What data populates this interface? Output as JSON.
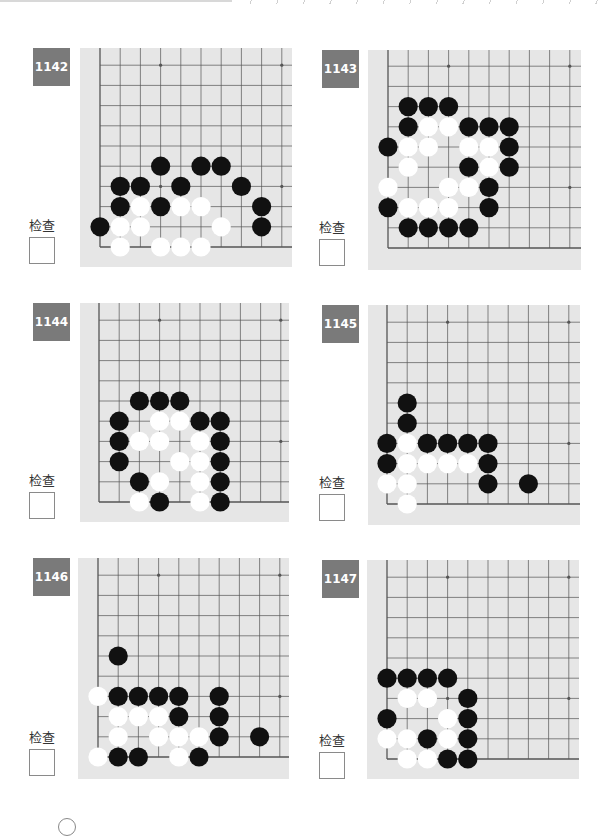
{
  "header": {
    "decoration": "dashed-rule"
  },
  "check_label": "检查",
  "colors": {
    "badge": "#7a7a7a",
    "board": "#e6e6e6",
    "line": "#555555",
    "black": "#111111",
    "white": "#ffffff"
  },
  "problems": [
    {
      "number": "1142",
      "badge": {
        "x": 33,
        "y": 48
      },
      "board": {
        "x": 80,
        "y": 48,
        "w": 212,
        "h": 219
      },
      "origin": {
        "x": 100,
        "y": 247
      },
      "step": 20.2,
      "check": {
        "x": 30,
        "y": 215
      },
      "black": [
        [
          0,
          1
        ],
        [
          8,
          1
        ],
        [
          1,
          2
        ],
        [
          3,
          2
        ],
        [
          8,
          2
        ],
        [
          1,
          3
        ],
        [
          2,
          3
        ],
        [
          4,
          3
        ],
        [
          7,
          3
        ],
        [
          3,
          4
        ],
        [
          5,
          4
        ],
        [
          6,
          4
        ]
      ],
      "white": [
        [
          1,
          0
        ],
        [
          3,
          0
        ],
        [
          4,
          0
        ],
        [
          5,
          0
        ],
        [
          1,
          1
        ],
        [
          2,
          1
        ],
        [
          6,
          1
        ],
        [
          2,
          2
        ],
        [
          4,
          2
        ],
        [
          5,
          2
        ]
      ]
    },
    {
      "number": "1143",
      "badge": {
        "x": 322,
        "y": 50
      },
      "board": {
        "x": 368,
        "y": 50,
        "w": 213,
        "h": 220
      },
      "origin": {
        "x": 388,
        "y": 248
      },
      "step": 20.2,
      "check": {
        "x": 320,
        "y": 217
      },
      "black": [
        [
          1,
          1
        ],
        [
          2,
          1
        ],
        [
          3,
          1
        ],
        [
          4,
          1
        ],
        [
          0,
          2
        ],
        [
          5,
          2
        ],
        [
          5,
          3
        ],
        [
          4,
          4
        ],
        [
          6,
          4
        ],
        [
          0,
          5
        ],
        [
          6,
          5
        ],
        [
          1,
          6
        ],
        [
          4,
          6
        ],
        [
          5,
          6
        ],
        [
          6,
          6
        ],
        [
          1,
          7
        ],
        [
          2,
          7
        ],
        [
          3,
          7
        ]
      ],
      "white": [
        [
          1,
          2
        ],
        [
          2,
          2
        ],
        [
          3,
          2
        ],
        [
          0,
          3
        ],
        [
          3,
          3
        ],
        [
          4,
          3
        ],
        [
          1,
          4
        ],
        [
          5,
          4
        ],
        [
          1,
          5
        ],
        [
          2,
          5
        ],
        [
          4,
          5
        ],
        [
          5,
          5
        ],
        [
          2,
          6
        ],
        [
          3,
          6
        ]
      ]
    },
    {
      "number": "1144",
      "badge": {
        "x": 33,
        "y": 303
      },
      "board": {
        "x": 80,
        "y": 303,
        "w": 209,
        "h": 219
      },
      "origin": {
        "x": 99,
        "y": 502
      },
      "step": 20.2,
      "check": {
        "x": 30,
        "y": 470
      },
      "black": [
        [
          3,
          0
        ],
        [
          6,
          0
        ],
        [
          2,
          1
        ],
        [
          6,
          1
        ],
        [
          1,
          2
        ],
        [
          6,
          2
        ],
        [
          1,
          3
        ],
        [
          6,
          3
        ],
        [
          1,
          4
        ],
        [
          5,
          4
        ],
        [
          6,
          4
        ],
        [
          2,
          5
        ],
        [
          3,
          5
        ],
        [
          4,
          5
        ]
      ],
      "white": [
        [
          2,
          0
        ],
        [
          5,
          0
        ],
        [
          3,
          1
        ],
        [
          5,
          1
        ],
        [
          4,
          2
        ],
        [
          5,
          2
        ],
        [
          2,
          3
        ],
        [
          3,
          3
        ],
        [
          5,
          3
        ],
        [
          3,
          4
        ],
        [
          4,
          4
        ]
      ]
    },
    {
      "number": "1145",
      "badge": {
        "x": 322,
        "y": 305
      },
      "board": {
        "x": 368,
        "y": 305,
        "w": 212,
        "h": 220
      },
      "origin": {
        "x": 387,
        "y": 504
      },
      "step": 20.2,
      "check": {
        "x": 320,
        "y": 472
      },
      "black": [
        [
          5,
          1
        ],
        [
          7,
          1
        ],
        [
          0,
          2
        ],
        [
          5,
          2
        ],
        [
          0,
          3
        ],
        [
          2,
          3
        ],
        [
          3,
          3
        ],
        [
          4,
          3
        ],
        [
          5,
          3
        ],
        [
          1,
          4
        ],
        [
          1,
          5
        ]
      ],
      "white": [
        [
          1,
          0
        ],
        [
          0,
          1
        ],
        [
          1,
          1
        ],
        [
          1,
          2
        ],
        [
          2,
          2
        ],
        [
          3,
          2
        ],
        [
          4,
          2
        ],
        [
          1,
          3
        ]
      ]
    },
    {
      "number": "1146",
      "badge": {
        "x": 33,
        "y": 558
      },
      "board": {
        "x": 78,
        "y": 558,
        "w": 211,
        "h": 221
      },
      "origin": {
        "x": 98,
        "y": 757
      },
      "step": 20.2,
      "check": {
        "x": 30,
        "y": 727
      },
      "black": [
        [
          1,
          0
        ],
        [
          2,
          0
        ],
        [
          5,
          0
        ],
        [
          6,
          1
        ],
        [
          8,
          1
        ],
        [
          4,
          2
        ],
        [
          6,
          2
        ],
        [
          1,
          3
        ],
        [
          2,
          3
        ],
        [
          3,
          3
        ],
        [
          4,
          3
        ],
        [
          6,
          3
        ],
        [
          1,
          5
        ]
      ],
      "white": [
        [
          0,
          0
        ],
        [
          4,
          0
        ],
        [
          1,
          1
        ],
        [
          3,
          1
        ],
        [
          4,
          1
        ],
        [
          5,
          1
        ],
        [
          1,
          2
        ],
        [
          2,
          2
        ],
        [
          3,
          2
        ],
        [
          0,
          3
        ]
      ]
    },
    {
      "number": "1147",
      "badge": {
        "x": 322,
        "y": 560
      },
      "board": {
        "x": 367,
        "y": 560,
        "w": 212,
        "h": 219
      },
      "origin": {
        "x": 387,
        "y": 759
      },
      "step": 20.2,
      "check": {
        "x": 320,
        "y": 730
      },
      "black": [
        [
          3,
          0
        ],
        [
          4,
          0
        ],
        [
          2,
          1
        ],
        [
          4,
          1
        ],
        [
          0,
          2
        ],
        [
          4,
          2
        ],
        [
          4,
          3
        ],
        [
          0,
          4
        ],
        [
          1,
          4
        ],
        [
          2,
          4
        ],
        [
          3,
          4
        ]
      ],
      "white": [
        [
          1,
          0
        ],
        [
          2,
          0
        ],
        [
          0,
          1
        ],
        [
          1,
          1
        ],
        [
          3,
          1
        ],
        [
          3,
          2
        ],
        [
          1,
          3
        ],
        [
          2,
          3
        ]
      ]
    }
  ],
  "footer": {
    "page_marker": "circle"
  }
}
